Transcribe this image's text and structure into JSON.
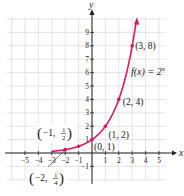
{
  "chart_data": {
    "type": "line",
    "title": "",
    "function_label": "f(x) = 2^x",
    "xlabel": "x",
    "ylabel": "y",
    "xlim": [
      -5,
      5
    ],
    "ylim": [
      -1,
      9
    ],
    "x_ticks": [
      "-5",
      "-4",
      "-3",
      "-2",
      "-1",
      "1",
      "2",
      "3",
      "4",
      "5"
    ],
    "y_ticks": [
      "-1",
      "1",
      "2",
      "3",
      "4",
      "5",
      "6",
      "7",
      "8",
      "9"
    ],
    "grid": true,
    "series": [
      {
        "name": "f(x) = 2^x",
        "color": "#d81b60",
        "points": [
          {
            "x": -2,
            "y": 0.25,
            "label": "(−2, 1/4)"
          },
          {
            "x": -1,
            "y": 0.5,
            "label": "(−1, 1/2)"
          },
          {
            "x": 0,
            "y": 1,
            "label": "(0, 1)"
          },
          {
            "x": 1,
            "y": 2,
            "label": "(1, 2)"
          },
          {
            "x": 2,
            "y": 4,
            "label": "(2, 4)"
          },
          {
            "x": 3,
            "y": 8,
            "label": "(3, 8)"
          }
        ]
      }
    ]
  }
}
